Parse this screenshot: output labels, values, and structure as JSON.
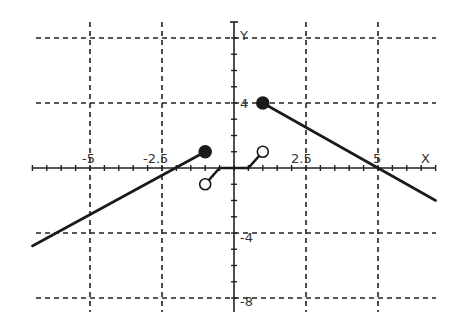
{
  "chart_data": {
    "type": "line",
    "title": "",
    "xlabel": "X",
    "ylabel": "Y",
    "xlim": [
      -7,
      7
    ],
    "ylim": [
      -8.5,
      8
    ],
    "grid": true,
    "grid_style": "dashed",
    "x_ticks": [
      -5,
      -2.5,
      2.5,
      5
    ],
    "x_tick_labels": [
      "-5",
      "-2.5",
      "2.5",
      "5"
    ],
    "y_ticks": [
      4,
      -4,
      -8
    ],
    "y_tick_labels": [
      "4",
      "-4",
      "-8"
    ],
    "x_minor_tick_step": 0.5,
    "y_minor_tick_step": 1,
    "series": [
      {
        "name": "left-piece",
        "points": [
          [
            -7,
            -4.8
          ],
          [
            -1,
            1
          ]
        ],
        "end_marker": {
          "x": -1,
          "y": 1,
          "type": "filled"
        }
      },
      {
        "name": "middle-piece",
        "points": [
          [
            -1,
            -1
          ],
          [
            -0.5,
            0
          ],
          [
            0.5,
            0
          ],
          [
            1,
            1
          ]
        ],
        "start_marker": {
          "x": -1,
          "y": -1,
          "type": "open"
        },
        "end_marker": {
          "x": 1,
          "y": 1,
          "type": "open"
        }
      },
      {
        "name": "right-piece",
        "points": [
          [
            1,
            4
          ],
          [
            5,
            0
          ],
          [
            7,
            -2
          ]
        ],
        "start_marker": {
          "x": 1,
          "y": 4,
          "type": "filled"
        }
      }
    ],
    "line_color": "#1a1a1a"
  },
  "labels": {
    "x_axis": "X",
    "y_axis": "Y",
    "x_neg5": "-5",
    "x_neg2_5": "-2.5",
    "x_2_5": "2.5",
    "x_5": "5",
    "y_4": "4",
    "y_neg4": "-4",
    "y_neg8": "-8"
  }
}
